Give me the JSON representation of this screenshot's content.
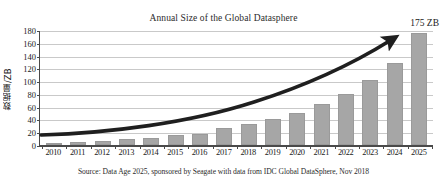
{
  "chart_data": {
    "type": "bar",
    "title": "Annual Size of the Global Datasphere",
    "xlabel": "",
    "ylabel": "数据量/ZB",
    "categories": [
      "2010",
      "2011",
      "2012",
      "2013",
      "2014",
      "2015",
      "2016",
      "2017",
      "2018",
      "2019",
      "2020",
      "2021",
      "2022",
      "2023",
      "2024",
      "2025"
    ],
    "values": [
      2,
      5,
      6.5,
      9,
      11,
      15.5,
      18,
      26,
      33,
      41,
      50,
      64,
      80,
      101,
      129,
      175
    ],
    "series": [
      {
        "name": "Global Datasphere size (ZB)",
        "values": [
          2,
          5,
          6.5,
          9,
          11,
          15.5,
          18,
          26,
          33,
          41,
          50,
          64,
          80,
          101,
          129,
          175
        ]
      }
    ],
    "ylim": [
      0,
      180
    ],
    "yticks": [
      0,
      20,
      40,
      60,
      80,
      100,
      120,
      140,
      160,
      180
    ],
    "ytick_labels": [
      "0",
      "20",
      "40",
      "60",
      "80",
      "100",
      "120",
      "140",
      "160",
      "180"
    ],
    "grid": true,
    "legend": false,
    "legend_position": "none",
    "bar_color": "#a6a6a6",
    "axis_color": "#4a4a4a",
    "grid_color": "#c9c9c9",
    "annotations": [
      {
        "name": "end-value-callout",
        "text": "175 ZB",
        "target_year": "2025",
        "value": 175
      },
      {
        "name": "trend-arrow",
        "text": "",
        "description": "thick black exponential growth arrow rising from 2010 to 2025"
      }
    ],
    "source_note": "Source: Data Age 2025, sponsored by Seagate with data from IDC Global DataSphere, Nov 2018"
  }
}
